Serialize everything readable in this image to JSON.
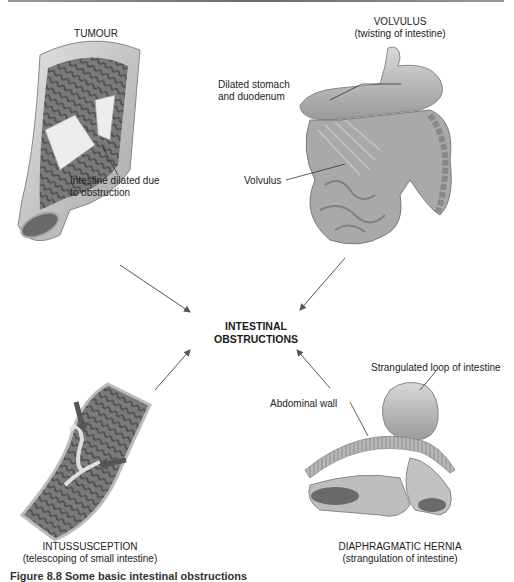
{
  "diagram": {
    "center_label": [
      "INTESTINAL",
      "OBSTRUCTIONS"
    ],
    "panels": {
      "tumour": {
        "title": [
          "TUMOUR"
        ],
        "annotations": [
          "Intestine dilated due",
          "to obstruction"
        ]
      },
      "volvulus": {
        "title": [
          "VOLVULUS",
          "(twisting of intestine)"
        ],
        "annotations": {
          "stomach": [
            "Dilated stomach",
            "and duodenum"
          ],
          "volvulus": "Volvulus"
        }
      },
      "intussusception": {
        "title": [
          "INTUSSUSCEPTION",
          "(telescoping of small intestine)"
        ]
      },
      "hernia": {
        "title": [
          "DIAPHRAGMATIC HERNIA",
          "(strangulation of intestine)"
        ],
        "annotations": {
          "loop": "Strangulated loop of intestine",
          "wall": "Abdominal wall"
        }
      }
    },
    "caption": "Figure 8.8 Some basic intestinal obstructions"
  },
  "colors": {
    "tissue_light": "#d4d4d4",
    "tissue_mid": "#a8a8a8",
    "tissue_dark": "#5a5a5a",
    "arrow": "#555555",
    "text": "#222222"
  }
}
